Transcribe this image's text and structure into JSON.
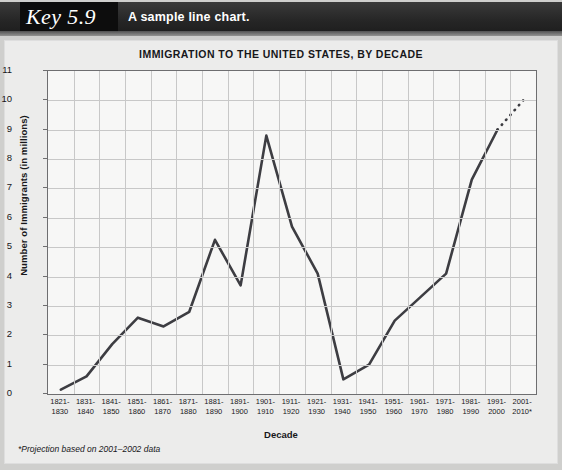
{
  "header": {
    "key_label": "Key 5.9",
    "caption": "A sample line chart."
  },
  "chart_data": {
    "type": "line",
    "title": "IMMIGRATION TO THE UNITED STATES, BY DECADE",
    "xlabel": "Decade",
    "ylabel": "Number of Immigrants (in millions)",
    "ylim": [
      0,
      11
    ],
    "ytick_labels": [
      "0",
      "1",
      "2",
      "3",
      "4",
      "5",
      "6",
      "7",
      "8",
      "9",
      "10",
      "11"
    ],
    "grid": true,
    "legend": "none",
    "footnote": "*Projection based on 2001–2002 data",
    "categories": [
      "1821-\n1830",
      "1831-\n1840",
      "1841-\n1850",
      "1851-\n1860",
      "1861-\n1870",
      "1871-\n1880",
      "1881-\n1890",
      "1891-\n1900",
      "1901-\n1910",
      "1911-\n1920",
      "1921-\n1930",
      "1931-\n1940",
      "1941-\n1950",
      "1951-\n1960",
      "1961-\n1970",
      "1971-\n1980",
      "1981-\n1990",
      "1991-\n2000",
      "2001-\n2010*"
    ],
    "categories_top": [
      "1821-",
      "1831-",
      "1841-",
      "1851-",
      "1861-",
      "1871-",
      "1881-",
      "1891-",
      "1901-",
      "1911-",
      "1921-",
      "1931-",
      "1941-",
      "1951-",
      "1961-",
      "1971-",
      "1981-",
      "1991-",
      "2001-"
    ],
    "categories_bottom": [
      "1830",
      "1840",
      "1850",
      "1860",
      "1870",
      "1880",
      "1890",
      "1900",
      "1910",
      "1920",
      "1930",
      "1940",
      "1950",
      "1960",
      "1970",
      "1980",
      "1990",
      "2000",
      "2010*"
    ],
    "values": [
      0.15,
      0.6,
      1.7,
      2.6,
      2.3,
      2.8,
      5.25,
      3.7,
      8.8,
      5.7,
      4.1,
      0.5,
      1.0,
      2.5,
      3.3,
      4.1,
      7.3,
      9.0,
      10.0
    ],
    "projected_from_index": 17,
    "series_color": "#3d3d42",
    "grid_color": "#c8c8c8",
    "axis_color": "#6e6e70",
    "plot_bg": "#f7f7f6"
  }
}
